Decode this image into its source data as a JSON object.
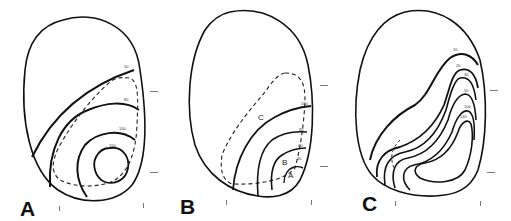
{
  "figure": {
    "panels": [
      {
        "id": "A",
        "letter": "A",
        "contour_labels": [
          "50",
          "80",
          "100",
          "150"
        ],
        "region_labels": []
      },
      {
        "id": "B",
        "letter": "B",
        "contour_labels": [
          "100",
          "80",
          "60",
          "40"
        ],
        "region_labels": [
          "C",
          "B",
          "A"
        ]
      },
      {
        "id": "C",
        "letter": "C",
        "contour_labels": [
          "10",
          "20",
          "30",
          "50",
          "100",
          "140"
        ],
        "region_labels": []
      }
    ],
    "line_color": "#111111",
    "background": "#ffffff"
  }
}
